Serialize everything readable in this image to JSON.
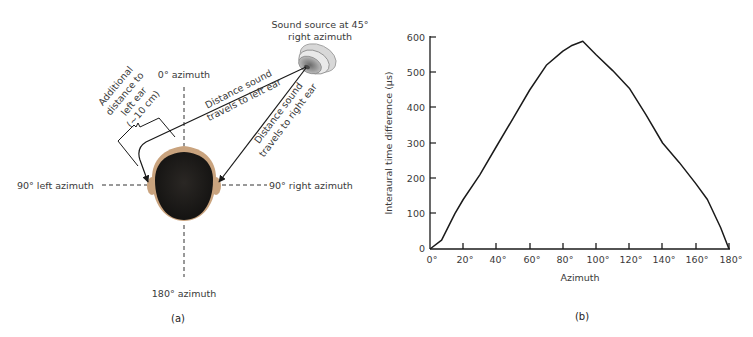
{
  "panel_a": {
    "caption": "(a)",
    "labels": {
      "source": [
        "Sound source at 45°",
        "right azimuth"
      ],
      "zero_azimuth": "0° azimuth",
      "left_azimuth": "90° left azimuth",
      "right_azimuth": "90° right azimuth",
      "back_azimuth": "180° azimuth",
      "left_path": [
        "Distance sound",
        "travels to left ear"
      ],
      "right_path": [
        "Distance sound",
        "travels to right ear"
      ],
      "additional": [
        "Additional",
        "distance to",
        "left ear",
        "(~10 cm)"
      ]
    },
    "colors": {
      "hair": "#1c1a18",
      "skin": "#c9a37e",
      "speaker_outer": "#dcdcdc",
      "speaker_inner": "#8f8f8f",
      "line": "#1a1a1a"
    }
  },
  "panel_b": {
    "caption": "(b)"
  },
  "chart_data": {
    "type": "line",
    "title": "",
    "xlabel": "Azimuth",
    "ylabel": "Interaural time difference (µs)",
    "xlim": [
      0,
      180
    ],
    "ylim": [
      0,
      600
    ],
    "x_ticks": [
      "0°",
      "20°",
      "40°",
      "60°",
      "80°",
      "100°",
      "120°",
      "140°",
      "160°",
      "180°"
    ],
    "y_ticks": [
      "0",
      "100",
      "200",
      "300",
      "400",
      "500",
      "600"
    ],
    "grid": false,
    "legend": null,
    "series": [
      {
        "name": "ITD",
        "x": [
          0,
          7,
          15,
          20,
          30,
          40,
          50,
          60,
          70,
          80,
          85,
          92,
          100,
          110,
          120,
          130,
          140,
          150,
          160,
          167,
          175,
          180
        ],
        "y": [
          0,
          25,
          100,
          140,
          210,
          290,
          370,
          450,
          520,
          560,
          575,
          588,
          550,
          505,
          455,
          380,
          300,
          245,
          185,
          140,
          60,
          0
        ]
      }
    ]
  }
}
